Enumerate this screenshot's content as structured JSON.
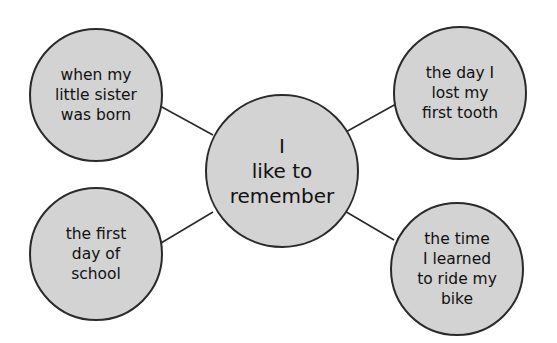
{
  "diagram": {
    "type": "web-organizer",
    "colors": {
      "fill": "#d3d3d3",
      "stroke": "#2a2a2a",
      "text": "#111111",
      "background": "#ffffff"
    },
    "center": {
      "lines": [
        "I",
        "like to",
        "remember"
      ]
    },
    "nodes": [
      {
        "id": "top-left",
        "lines": [
          "when my",
          "little sister",
          "was born"
        ]
      },
      {
        "id": "top-right",
        "lines": [
          "the day I",
          "lost my",
          "first tooth"
        ]
      },
      {
        "id": "bottom-left",
        "lines": [
          "the first",
          "day of",
          "school"
        ]
      },
      {
        "id": "bottom-right",
        "lines": [
          "the time",
          "I learned",
          "to ride my",
          "bike"
        ]
      }
    ]
  }
}
